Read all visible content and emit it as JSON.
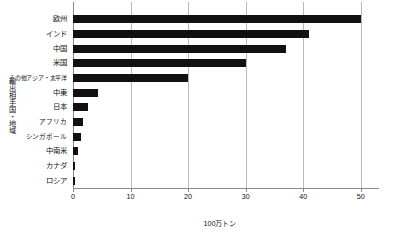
{
  "chart_data": {
    "type": "bar",
    "orientation": "horizontal",
    "title": "",
    "xlabel": "100万トン",
    "ylabel": "輸出相手国・地域",
    "xlim": [
      0,
      53
    ],
    "xticks": [
      0,
      10,
      20,
      30,
      40,
      50
    ],
    "grid": true,
    "legend": "none",
    "bar_color": "#111111",
    "grid_color": "#b9b9b9",
    "categories": [
      "欧州",
      "インド",
      "中国",
      "米国",
      "その他アジア・太平洋",
      "中東",
      "日本",
      "アフリカ",
      "シンガポール",
      "中南米",
      "カナダ",
      "ロシア"
    ],
    "values": [
      50.0,
      41.0,
      37.0,
      30.0,
      20.0,
      4.3,
      2.6,
      1.8,
      1.4,
      0.8,
      0.4,
      0.3
    ]
  }
}
